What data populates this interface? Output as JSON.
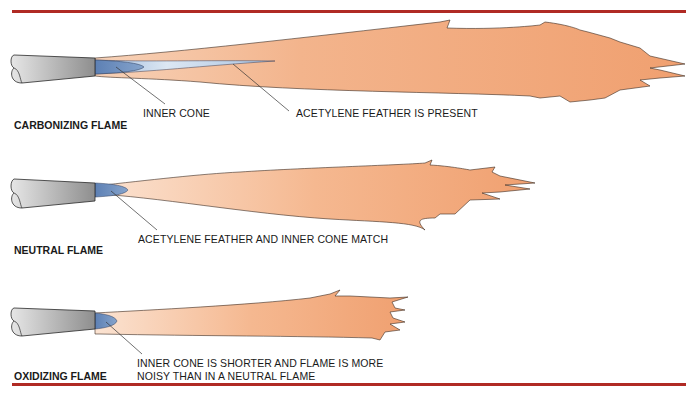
{
  "colors": {
    "rule": "#b02a24",
    "flame": "#f2a578",
    "inner_cone": "#6f90c0",
    "feather": "#c9d9ec",
    "tip": "#9a9a9a"
  },
  "panels": [
    {
      "title": "CARBONIZING FLAME",
      "callouts": [
        "INNER CONE",
        "ACETYLENE FEATHER IS PRESENT"
      ]
    },
    {
      "title": "NEUTRAL FLAME",
      "callouts": [
        "ACETYLENE FEATHER AND INNER CONE MATCH"
      ]
    },
    {
      "title": "OXIDIZING FLAME",
      "callouts": [
        "INNER CONE IS SHORTER AND FLAME IS MORE",
        "NOISY THAN IN A NEUTRAL FLAME"
      ]
    }
  ]
}
